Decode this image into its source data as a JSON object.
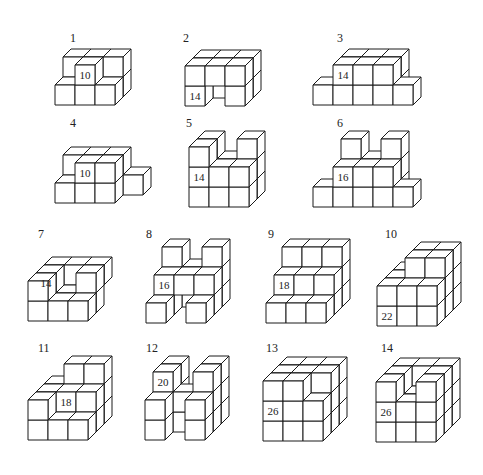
{
  "cube": {
    "size": 20,
    "depth_dx": 8,
    "depth_dy": 8,
    "stroke": "#1a1a1a",
    "fill": "#ffffff"
  },
  "figures": [
    {
      "id": "1",
      "label": "1",
      "label_pos": [
        70,
        42
      ],
      "origin": [
        55,
        105
      ],
      "cubes": [
        [
          0,
          0,
          1
        ],
        [
          1,
          0,
          1
        ],
        [
          2,
          0,
          1
        ],
        [
          0,
          0,
          0
        ],
        [
          1,
          0,
          0
        ],
        [
          2,
          0,
          0
        ],
        [
          0,
          1,
          1
        ],
        [
          1,
          1,
          1
        ],
        [
          2,
          1,
          1
        ],
        [
          1,
          1,
          0
        ]
      ],
      "face_label": {
        "text": "10",
        "cube": [
          1,
          1,
          0
        ]
      }
    },
    {
      "id": "2",
      "label": "2",
      "label_pos": [
        183,
        42
      ],
      "origin": [
        185,
        106
      ],
      "cubes": [
        [
          0,
          0,
          1
        ],
        [
          1,
          0,
          1
        ],
        [
          2,
          0,
          1
        ],
        [
          0,
          0,
          0
        ],
        [
          2,
          0,
          0
        ],
        [
          0,
          1,
          1
        ],
        [
          1,
          1,
          1
        ],
        [
          2,
          1,
          1
        ],
        [
          0,
          1,
          0
        ],
        [
          1,
          1,
          0
        ],
        [
          2,
          1,
          0
        ]
      ],
      "face_label": {
        "text": "14",
        "cube": [
          0,
          0,
          0
        ]
      }
    },
    {
      "id": "3",
      "label": "3",
      "label_pos": [
        337,
        42
      ],
      "origin": [
        313,
        105
      ],
      "cubes": [
        [
          0,
          0,
          0
        ],
        [
          1,
          0,
          1
        ],
        [
          2,
          0,
          1
        ],
        [
          3,
          0,
          1
        ],
        [
          1,
          0,
          0
        ],
        [
          2,
          0,
          0
        ],
        [
          3,
          0,
          0
        ],
        [
          4,
          0,
          0
        ],
        [
          1,
          1,
          1
        ],
        [
          2,
          1,
          1
        ],
        [
          3,
          1,
          1
        ],
        [
          1,
          1,
          0
        ],
        [
          2,
          1,
          0
        ],
        [
          3,
          1,
          0
        ]
      ],
      "face_label": {
        "text": "14",
        "cube": [
          1,
          1,
          0
        ]
      }
    },
    {
      "id": "4",
      "label": "4",
      "label_pos": [
        70,
        127
      ],
      "origin": [
        55,
        203
      ],
      "cubes": [
        [
          0,
          0,
          1
        ],
        [
          1,
          0,
          1
        ],
        [
          2,
          0,
          1
        ],
        [
          3,
          0,
          1
        ],
        [
          0,
          0,
          0
        ],
        [
          1,
          0,
          0
        ],
        [
          2,
          0,
          0
        ],
        [
          0,
          1,
          1
        ],
        [
          1,
          1,
          1
        ],
        [
          2,
          1,
          1
        ],
        [
          1,
          1,
          0
        ],
        [
          2,
          1,
          0
        ]
      ],
      "face_label": {
        "text": "10",
        "cube": [
          1,
          1,
          0
        ]
      }
    },
    {
      "id": "5",
      "label": "5",
      "label_pos": [
        186,
        127
      ],
      "origin": [
        189,
        207
      ],
      "cubes": [
        [
          0,
          0,
          1
        ],
        [
          1,
          0,
          1
        ],
        [
          2,
          0,
          1
        ],
        [
          0,
          0,
          0
        ],
        [
          1,
          0,
          0
        ],
        [
          2,
          0,
          0
        ],
        [
          0,
          1,
          1
        ],
        [
          1,
          1,
          1
        ],
        [
          2,
          1,
          1
        ],
        [
          0,
          1,
          0
        ],
        [
          1,
          1,
          0
        ],
        [
          2,
          1,
          0
        ],
        [
          0,
          2,
          1
        ],
        [
          2,
          2,
          1
        ],
        [
          0,
          2,
          0
        ]
      ],
      "face_label": {
        "text": "14",
        "cube": [
          0,
          1,
          0
        ]
      }
    },
    {
      "id": "6",
      "label": "6",
      "label_pos": [
        337,
        127
      ],
      "origin": [
        313,
        207
      ],
      "cubes": [
        [
          0,
          0,
          0
        ],
        [
          1,
          0,
          1
        ],
        [
          2,
          0,
          1
        ],
        [
          3,
          0,
          1
        ],
        [
          1,
          0,
          0
        ],
        [
          2,
          0,
          0
        ],
        [
          3,
          0,
          0
        ],
        [
          4,
          0,
          0
        ],
        [
          1,
          1,
          1
        ],
        [
          2,
          1,
          1
        ],
        [
          3,
          1,
          1
        ],
        [
          1,
          1,
          0
        ],
        [
          2,
          1,
          0
        ],
        [
          3,
          1,
          0
        ],
        [
          1,
          2,
          1
        ],
        [
          3,
          2,
          1
        ]
      ],
      "face_label": {
        "text": "16",
        "cube": [
          1,
          1,
          0
        ]
      }
    },
    {
      "id": "7",
      "label": "7",
      "label_pos": [
        38,
        238
      ],
      "origin": [
        28,
        321
      ],
      "cubes": [
        [
          0,
          0,
          1
        ],
        [
          1,
          0,
          1
        ],
        [
          2,
          0,
          1
        ],
        [
          0,
          0,
          0
        ],
        [
          1,
          0,
          0
        ],
        [
          2,
          0,
          0
        ],
        [
          0,
          1,
          2
        ],
        [
          1,
          1,
          2
        ],
        [
          2,
          1,
          2
        ],
        [
          0,
          1,
          1
        ],
        [
          2,
          1,
          1
        ],
        [
          0,
          1,
          0
        ]
      ],
      "face_label": {
        "text": "14",
        "cube": [
          0,
          1,
          1
        ]
      }
    },
    {
      "id": "8",
      "label": "8",
      "label_pos": [
        146,
        238
      ],
      "origin": [
        146,
        323
      ],
      "cubes": [
        [
          0,
          0,
          2
        ],
        [
          1,
          0,
          2
        ],
        [
          2,
          0,
          2
        ],
        [
          0,
          0,
          1
        ],
        [
          2,
          0,
          1
        ],
        [
          0,
          0,
          0
        ],
        [
          2,
          0,
          0
        ],
        [
          0,
          1,
          2
        ],
        [
          1,
          1,
          2
        ],
        [
          2,
          1,
          2
        ],
        [
          0,
          1,
          1
        ],
        [
          1,
          1,
          1
        ],
        [
          2,
          1,
          1
        ],
        [
          0,
          2,
          2
        ],
        [
          2,
          2,
          2
        ]
      ],
      "face_label": {
        "text": "16",
        "cube": [
          0,
          1,
          1
        ]
      }
    },
    {
      "id": "9",
      "label": "9",
      "label_pos": [
        268,
        238
      ],
      "origin": [
        266,
        323
      ],
      "cubes": [
        [
          0,
          0,
          2
        ],
        [
          1,
          0,
          2
        ],
        [
          2,
          0,
          2
        ],
        [
          0,
          0,
          1
        ],
        [
          1,
          0,
          1
        ],
        [
          2,
          0,
          1
        ],
        [
          0,
          0,
          0
        ],
        [
          1,
          0,
          0
        ],
        [
          2,
          0,
          0
        ],
        [
          0,
          1,
          2
        ],
        [
          1,
          1,
          2
        ],
        [
          2,
          1,
          2
        ],
        [
          0,
          1,
          1
        ],
        [
          1,
          1,
          1
        ],
        [
          2,
          1,
          1
        ],
        [
          0,
          2,
          2
        ],
        [
          1,
          2,
          2
        ],
        [
          2,
          2,
          2
        ]
      ],
      "face_label": {
        "text": "18",
        "cube": [
          0,
          1,
          1
        ]
      }
    },
    {
      "id": "10",
      "label": "10",
      "label_pos": [
        385,
        238
      ],
      "origin": [
        377,
        326
      ],
      "cubes": [
        [
          0,
          0,
          2
        ],
        [
          1,
          0,
          2
        ],
        [
          2,
          0,
          2
        ],
        [
          0,
          0,
          1
        ],
        [
          1,
          0,
          1
        ],
        [
          2,
          0,
          1
        ],
        [
          0,
          0,
          0
        ],
        [
          1,
          0,
          0
        ],
        [
          2,
          0,
          0
        ],
        [
          0,
          1,
          2
        ],
        [
          1,
          1,
          2
        ],
        [
          2,
          1,
          2
        ],
        [
          0,
          1,
          1
        ],
        [
          1,
          1,
          1
        ],
        [
          2,
          1,
          1
        ],
        [
          0,
          1,
          0
        ],
        [
          1,
          1,
          0
        ],
        [
          2,
          1,
          0
        ],
        [
          1,
          2,
          2
        ],
        [
          2,
          2,
          2
        ],
        [
          1,
          2,
          1
        ],
        [
          2,
          2,
          1
        ]
      ],
      "face_label": {
        "text": "22",
        "cube": [
          0,
          0,
          0
        ]
      }
    },
    {
      "id": "11",
      "label": "11",
      "label_pos": [
        38,
        352
      ],
      "origin": [
        28,
        440
      ],
      "cubes": [
        [
          0,
          0,
          2
        ],
        [
          1,
          0,
          2
        ],
        [
          2,
          0,
          2
        ],
        [
          0,
          0,
          1
        ],
        [
          1,
          0,
          1
        ],
        [
          2,
          0,
          1
        ],
        [
          0,
          0,
          0
        ],
        [
          1,
          0,
          0
        ],
        [
          2,
          0,
          0
        ],
        [
          0,
          1,
          2
        ],
        [
          1,
          1,
          2
        ],
        [
          2,
          1,
          2
        ],
        [
          0,
          1,
          1
        ],
        [
          1,
          1,
          1
        ],
        [
          2,
          1,
          1
        ],
        [
          0,
          1,
          0
        ],
        [
          1,
          2,
          2
        ],
        [
          2,
          2,
          2
        ]
      ],
      "face_label": {
        "text": "18",
        "cube": [
          1,
          1,
          1
        ]
      }
    },
    {
      "id": "12",
      "label": "12",
      "label_pos": [
        146,
        352
      ],
      "origin": [
        145,
        440
      ],
      "cubes": [
        [
          0,
          0,
          2
        ],
        [
          2,
          0,
          2
        ],
        [
          0,
          0,
          1
        ],
        [
          1,
          0,
          1
        ],
        [
          2,
          0,
          1
        ],
        [
          0,
          0,
          0
        ],
        [
          2,
          0,
          0
        ],
        [
          0,
          1,
          2
        ],
        [
          2,
          1,
          2
        ],
        [
          0,
          1,
          1
        ],
        [
          1,
          1,
          1
        ],
        [
          2,
          1,
          1
        ],
        [
          0,
          1,
          0
        ],
        [
          2,
          1,
          0
        ],
        [
          0,
          2,
          2
        ],
        [
          2,
          2,
          2
        ],
        [
          0,
          2,
          1
        ],
        [
          2,
          2,
          1
        ]
      ],
      "face_label": {
        "text": "20",
        "cube": [
          0,
          2,
          1
        ]
      }
    },
    {
      "id": "13",
      "label": "13",
      "label_pos": [
        266,
        352
      ],
      "origin": [
        263,
        441
      ],
      "cubes": [
        [
          0,
          0,
          2
        ],
        [
          1,
          0,
          2
        ],
        [
          2,
          0,
          2
        ],
        [
          0,
          0,
          1
        ],
        [
          1,
          0,
          1
        ],
        [
          2,
          0,
          1
        ],
        [
          0,
          0,
          0
        ],
        [
          1,
          0,
          0
        ],
        [
          2,
          0,
          0
        ],
        [
          0,
          1,
          2
        ],
        [
          1,
          1,
          2
        ],
        [
          2,
          1,
          2
        ],
        [
          0,
          1,
          1
        ],
        [
          1,
          1,
          1
        ],
        [
          2,
          1,
          1
        ],
        [
          0,
          1,
          0
        ],
        [
          1,
          1,
          0
        ],
        [
          2,
          1,
          0
        ],
        [
          0,
          2,
          2
        ],
        [
          1,
          2,
          2
        ],
        [
          2,
          2,
          2
        ],
        [
          0,
          2,
          1
        ],
        [
          1,
          2,
          1
        ],
        [
          2,
          2,
          1
        ],
        [
          0,
          2,
          0
        ],
        [
          1,
          2,
          0
        ]
      ],
      "face_label": {
        "text": "26",
        "cube": [
          0,
          1,
          0
        ]
      }
    },
    {
      "id": "14",
      "label": "14",
      "label_pos": [
        381,
        352
      ],
      "origin": [
        376,
        442
      ],
      "cubes": [
        [
          0,
          0,
          2
        ],
        [
          1,
          0,
          2
        ],
        [
          2,
          0,
          2
        ],
        [
          0,
          0,
          1
        ],
        [
          1,
          0,
          1
        ],
        [
          2,
          0,
          1
        ],
        [
          0,
          0,
          0
        ],
        [
          1,
          0,
          0
        ],
        [
          2,
          0,
          0
        ],
        [
          0,
          1,
          2
        ],
        [
          1,
          1,
          2
        ],
        [
          2,
          1,
          2
        ],
        [
          0,
          1,
          1
        ],
        [
          1,
          1,
          1
        ],
        [
          2,
          1,
          1
        ],
        [
          0,
          1,
          0
        ],
        [
          1,
          1,
          0
        ],
        [
          2,
          1,
          0
        ],
        [
          0,
          2,
          2
        ],
        [
          1,
          2,
          2
        ],
        [
          2,
          2,
          2
        ],
        [
          0,
          2,
          1
        ],
        [
          2,
          2,
          1
        ],
        [
          0,
          2,
          0
        ],
        [
          2,
          2,
          0
        ]
      ],
      "face_label": {
        "text": "26",
        "cube": [
          0,
          1,
          0
        ]
      }
    }
  ]
}
